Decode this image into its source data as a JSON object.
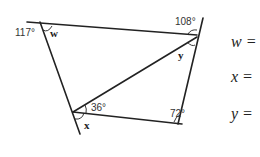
{
  "diagram": {
    "angles": {
      "top_left": "117°",
      "top_right": "108°",
      "inner_bottom_left": "36°",
      "bottom_right": "72°"
    },
    "variables": {
      "w": "w",
      "x": "x",
      "y": "y"
    },
    "line_color": "#222222"
  },
  "answers": [
    {
      "label": "w ="
    },
    {
      "label": "x ="
    },
    {
      "label": "y ="
    }
  ]
}
